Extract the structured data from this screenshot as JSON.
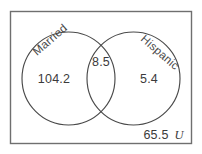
{
  "diagram": {
    "type": "venn-two-set",
    "universe": {
      "symbol": "U",
      "outside_value": "65.5"
    },
    "sets": [
      {
        "id": "married",
        "label": "Married",
        "only_value": "104.2"
      },
      {
        "id": "hispanic",
        "label": "Hispanic",
        "only_value": "5.4"
      }
    ],
    "intersection": {
      "label": "Married and Hispanic",
      "value": "8.5"
    },
    "colors": {
      "rectangle_stroke": "#6f6f6f",
      "circle_stroke": "#4a4a4a",
      "text": "#3b3b3b",
      "label_text": "#4a4a4a",
      "background": "#ffffff"
    }
  }
}
